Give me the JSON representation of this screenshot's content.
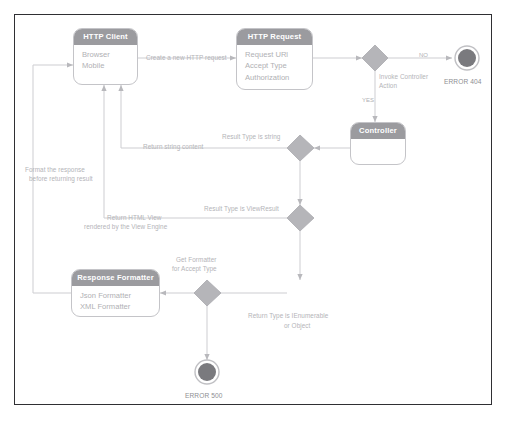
{
  "diagram": {
    "colors": {
      "frame_border": "#2f2f33",
      "node_header_bg": "#9b9b9f",
      "node_header_text": "#ffffff",
      "node_item_text": "#b0b0b4",
      "connector": "#c9c9cd",
      "decision_fill": "#b5b5b9",
      "final_node_fill": "#7a7a7e",
      "label_text": "#b4b4b8",
      "background": "#ffffff"
    },
    "nodes": [
      {
        "id": "http-client",
        "kind": "partition",
        "title": "HTTP Client",
        "items": [
          "Browser",
          "Mobile"
        ]
      },
      {
        "id": "http-request",
        "kind": "partition",
        "title": "HTTP Request",
        "items": [
          "Request URl",
          "Accept Type",
          "Authorization"
        ]
      },
      {
        "id": "controller",
        "kind": "partition",
        "title": "Controller",
        "items": []
      },
      {
        "id": "response-formatter",
        "kind": "partition",
        "title": "Response Formatter",
        "items": [
          "Json Formatter",
          "XML Formatter"
        ]
      }
    ],
    "decisions": [
      {
        "id": "invoke-controller-action",
        "label": "Invoke Controller\nAction",
        "label_line1": "Invoke Controller",
        "label_line2": "Action"
      },
      {
        "id": "result-type-string",
        "label": "Result Type is string"
      },
      {
        "id": "result-type-viewresult",
        "label": "Result Type is ViewResult"
      },
      {
        "id": "get-formatter",
        "label_line1": "Get Formatter",
        "label_line2": "for Accept Type"
      }
    ],
    "final_nodes": [
      {
        "id": "error-404",
        "caption": "ERROR 404"
      },
      {
        "id": "error-500",
        "caption": "ERROR 500"
      }
    ],
    "edge_labels": [
      {
        "id": "create-request",
        "text": "Create a new HTTP request"
      },
      {
        "id": "guard-no",
        "text": "NO"
      },
      {
        "id": "guard-yes",
        "text": "YES"
      },
      {
        "id": "result-type-string",
        "text": "Result Type is string"
      },
      {
        "id": "return-string-content",
        "text": "Return string content"
      },
      {
        "id": "result-type-viewresult",
        "text": "Result Type is ViewResult"
      },
      {
        "id": "return-html-view-line1",
        "text": "Return HTML View"
      },
      {
        "id": "return-html-view-line2",
        "text": "rendered by the View Engine"
      },
      {
        "id": "format-response-line1",
        "text": "Format the response"
      },
      {
        "id": "format-response-line2",
        "text": "before returning result"
      },
      {
        "id": "get-formatter-line1",
        "text": "Get Formatter"
      },
      {
        "id": "get-formatter-line2",
        "text": "for Accept Type"
      },
      {
        "id": "return-type-line1",
        "text": "Return Type is IEnumerable"
      },
      {
        "id": "return-type-line2",
        "text": "or Object"
      }
    ]
  }
}
